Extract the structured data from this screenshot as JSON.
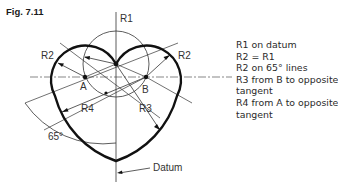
{
  "figure": {
    "title": "Fig. 7.11",
    "labels": {
      "r1": "R1",
      "r2_left": "R2",
      "r2_right": "R2",
      "point_a": "A",
      "point_b": "B",
      "r3": "R3",
      "r4": "R4",
      "angle": "65°",
      "datum": "Datum"
    },
    "legend": [
      "R1 on datum",
      "R2 = R1",
      "R2 on 65° lines",
      "R3 from B to opposite",
      "tangent",
      "R4 from A to opposite",
      "tangent"
    ]
  }
}
